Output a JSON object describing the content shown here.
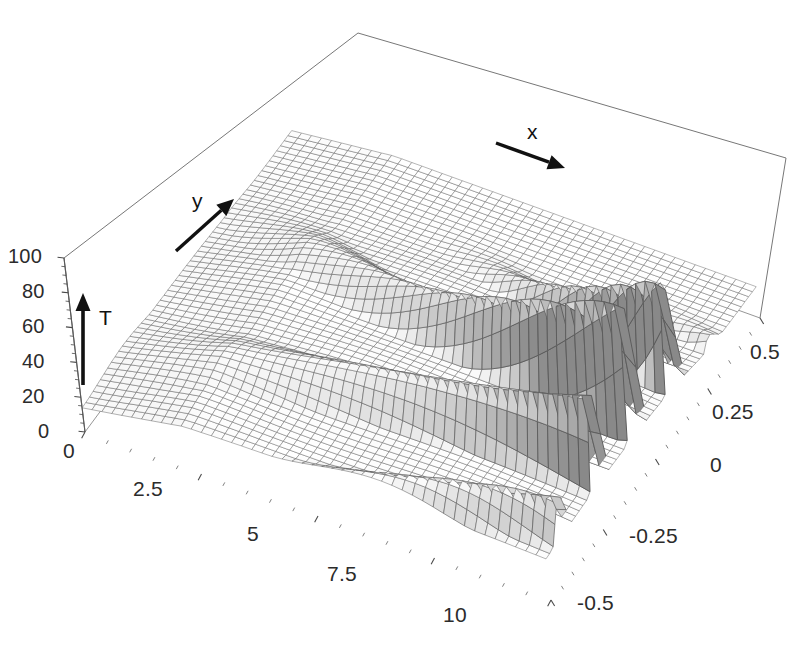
{
  "figure": {
    "kind": "3d-surface-mesh-plot",
    "background_color": "#ffffff",
    "line_color": "#4a4a4a",
    "frame_color": "#777777",
    "arrow_color": "#111111",
    "label_color": "#2b2b2b"
  },
  "axes": {
    "vertical": {
      "name": "T",
      "letter": "T",
      "ticks": [
        "100",
        "80",
        "60",
        "40",
        "20",
        "0"
      ],
      "tick_values": [
        100,
        80,
        60,
        40,
        20,
        0
      ],
      "range": [
        0,
        100
      ]
    },
    "depth": {
      "name": "y",
      "letter": "y",
      "ticks": [
        "0",
        "2.5",
        "5",
        "7.5",
        "10"
      ],
      "tick_values": [
        0,
        2.5,
        5,
        7.5,
        10
      ],
      "range": [
        0,
        10
      ]
    },
    "horizontal": {
      "name": "x",
      "letter": "x",
      "ticks": [
        "0.5",
        "0.25",
        "0",
        "-0.25",
        "-0.5"
      ],
      "tick_values": [
        0.5,
        0.25,
        0,
        -0.25,
        -0.5
      ],
      "range": [
        -0.5,
        0.5
      ]
    }
  },
  "tick_label_positions": {
    "t": [
      {
        "text": "100",
        "x": 8,
        "y": 246
      },
      {
        "text": "80",
        "x": 22,
        "y": 281
      },
      {
        "text": "60",
        "x": 22,
        "y": 316
      },
      {
        "text": "40",
        "x": 22,
        "y": 351
      },
      {
        "text": "20",
        "x": 22,
        "y": 386
      },
      {
        "text": "0",
        "x": 38,
        "y": 421
      }
    ],
    "y": [
      {
        "text": "0",
        "x": 63,
        "y": 440
      },
      {
        "text": "2.5",
        "x": 133,
        "y": 478
      },
      {
        "text": "5",
        "x": 247,
        "y": 523
      },
      {
        "text": "7.5",
        "x": 327,
        "y": 563
      },
      {
        "text": "10",
        "x": 443,
        "y": 604
      }
    ],
    "x": [
      {
        "text": "0.5",
        "x": 750,
        "y": 341
      },
      {
        "text": "0.25",
        "x": 712,
        "y": 401
      },
      {
        "text": "0",
        "x": 710,
        "y": 454
      },
      {
        "text": "-0.25",
        "x": 629,
        "y": 525
      },
      {
        "text": "-0.5",
        "x": 577,
        "y": 592
      }
    ]
  },
  "axis_arrows": {
    "x": {
      "letter": "x",
      "letter_x": 527,
      "letter_y": 121,
      "from": [
        496,
        143
      ],
      "to": [
        565,
        168
      ]
    },
    "y": {
      "letter": "y",
      "letter_x": 192,
      "letter_y": 190,
      "from": [
        176,
        251
      ],
      "to": [
        234,
        199
      ]
    },
    "t": {
      "letter": "T",
      "letter_x": 99,
      "letter_y": 307,
      "from": [
        83,
        385
      ],
      "to": [
        83,
        293
      ]
    }
  },
  "frame": {
    "top_apex": [
      358,
      33
    ],
    "left_top": [
      64,
      258
    ],
    "left_bottom": [
      85,
      432
    ],
    "right_top": [
      786,
      158
    ],
    "right_mid": [
      760,
      318
    ],
    "front_bottom": [
      551,
      600
    ],
    "back_right_lower": [
      760,
      318
    ]
  },
  "chart_data": {
    "type": "surface",
    "title": "",
    "xlabel": "x",
    "ylabel": "y",
    "zlabel": "T",
    "xlim": [
      -0.5,
      0.5
    ],
    "ylim": [
      0,
      10
    ],
    "zlim": [
      0,
      100
    ],
    "xticks": [
      -0.5,
      -0.25,
      0,
      0.25,
      0.5
    ],
    "yticks": [
      0,
      2.5,
      5,
      7.5,
      10
    ],
    "zticks": [
      0,
      20,
      40,
      60,
      80,
      100
    ],
    "grid": true,
    "legend": "none",
    "mesh": {
      "nx": 56,
      "ny": 46,
      "style": "wireframe-gray"
    },
    "model": {
      "baseline": 18,
      "plateau_bump": 12,
      "wave_center_x": -0.02,
      "wave_width": 0.27,
      "wave_number": 3.1,
      "wave_phase": 0.55,
      "amplitude_growth": "linear-in-y",
      "amplitude_at_y0": 6,
      "amplitude_at_y10": 78,
      "ripple_amp": 2.2,
      "ripple_k": 2.4,
      "edge_falloff": 0.35
    },
    "ridge_peaks": [
      {
        "y": 10.0,
        "x": -0.02,
        "T": 95
      },
      {
        "y": 9.0,
        "x": -0.19,
        "T": 82
      },
      {
        "y": 8.0,
        "x": -0.31,
        "T": 68
      },
      {
        "y": 7.0,
        "x": -0.4,
        "T": 55
      },
      {
        "y": 6.0,
        "x": -0.45,
        "T": 44
      },
      {
        "y": 5.0,
        "x": 0.05,
        "T": 38
      },
      {
        "y": 4.0,
        "x": 0.1,
        "T": 33
      },
      {
        "y": 3.0,
        "x": 0.14,
        "T": 30
      },
      {
        "y": 2.0,
        "x": 0.17,
        "T": 28
      },
      {
        "y": 1.0,
        "x": 0.2,
        "T": 26
      }
    ]
  }
}
